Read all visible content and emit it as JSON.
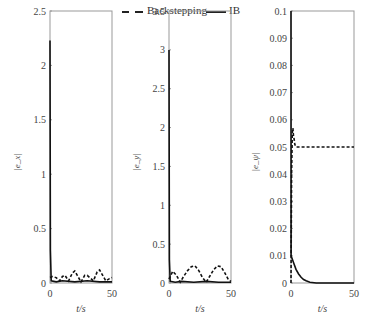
{
  "legend": {
    "entries": [
      {
        "label": "Backstepping",
        "style": "dashed"
      },
      {
        "label": "IB",
        "style": "solid"
      }
    ]
  },
  "chart_data": [
    {
      "type": "line",
      "title": "",
      "xlabel": "t/s",
      "ylabel": "|e_x|",
      "xlim": [
        0,
        50
      ],
      "ylim": [
        0,
        2.5
      ],
      "xticks": [
        "0",
        "50"
      ],
      "yticks": [
        "0",
        "0.5",
        "1",
        "1.5",
        "2",
        "2.5"
      ],
      "grid": false,
      "series": [
        {
          "name": "Backstepping",
          "x": [
            0,
            2,
            5,
            8,
            10,
            12,
            15,
            18,
            20,
            22,
            25,
            28,
            30,
            32,
            35,
            38,
            40,
            42,
            45,
            48,
            50
          ],
          "y": [
            0.05,
            0.06,
            0.05,
            0.02,
            0.06,
            0.07,
            0.02,
            0.09,
            0.11,
            0.07,
            0.01,
            0.07,
            0.07,
            0.05,
            0.02,
            0.1,
            0.12,
            0.08,
            0.02,
            0.04,
            0.05
          ]
        },
        {
          "name": "IB",
          "x": [
            0,
            0.3,
            1,
            5,
            10,
            20,
            30,
            40,
            50
          ],
          "y": [
            2.23,
            0.3,
            0.02,
            0.01,
            0.02,
            0.01,
            0.02,
            0.01,
            0.01
          ]
        }
      ]
    },
    {
      "type": "line",
      "title": "",
      "xlabel": "t/s",
      "ylabel": "|e_y|",
      "xlim": [
        0,
        50
      ],
      "ylim": [
        0,
        3.5
      ],
      "xticks": [
        "0",
        "50"
      ],
      "yticks": [
        "0",
        "0.5",
        "1",
        "1.5",
        "2",
        "2.5",
        "3",
        "3.5"
      ],
      "grid": false,
      "series": [
        {
          "name": "Backstepping",
          "x": [
            0,
            3,
            6,
            9,
            12,
            15,
            18,
            21,
            24,
            27,
            30,
            33,
            36,
            39,
            42,
            45,
            48,
            50
          ],
          "y": [
            0.05,
            0.15,
            0.1,
            0.01,
            0.09,
            0.16,
            0.21,
            0.22,
            0.16,
            0.07,
            0.01,
            0.09,
            0.17,
            0.22,
            0.21,
            0.13,
            0.04,
            0.02
          ]
        },
        {
          "name": "IB",
          "x": [
            0,
            0.3,
            1,
            5,
            10,
            20,
            30,
            40,
            50
          ],
          "y": [
            3.0,
            0.3,
            0.02,
            0.01,
            0.02,
            0.01,
            0.02,
            0.01,
            0.01
          ]
        }
      ]
    },
    {
      "type": "line",
      "title": "",
      "xlabel": "t/s",
      "ylabel": "|e_ψ|",
      "xlim": [
        0,
        50
      ],
      "ylim": [
        0,
        0.1
      ],
      "xticks": [
        "0",
        "50"
      ],
      "yticks": [
        "0",
        "0.01",
        "0.02",
        "0.03",
        "0.04",
        "0.05",
        "0.06",
        "0.07",
        "0.08",
        "0.09",
        "0.1"
      ],
      "grid": false,
      "series": [
        {
          "name": "Backstepping",
          "x": [
            0,
            0.5,
            1,
            1.5,
            2,
            2.5,
            3,
            4,
            10,
            20,
            30,
            40,
            50
          ],
          "y": [
            0.0,
            0.04,
            0.055,
            0.057,
            0.054,
            0.053,
            0.051,
            0.05,
            0.05,
            0.05,
            0.05,
            0.05,
            0.05
          ]
        },
        {
          "name": "IB",
          "x": [
            0,
            0.1,
            2,
            4,
            6,
            8,
            10,
            12,
            15,
            20,
            30,
            40,
            50
          ],
          "y": [
            0.1,
            0.01,
            0.0075,
            0.005,
            0.0033,
            0.0021,
            0.0013,
            0.0008,
            0.0003,
            0.0,
            0.0,
            0.0,
            0.0
          ]
        }
      ]
    }
  ]
}
